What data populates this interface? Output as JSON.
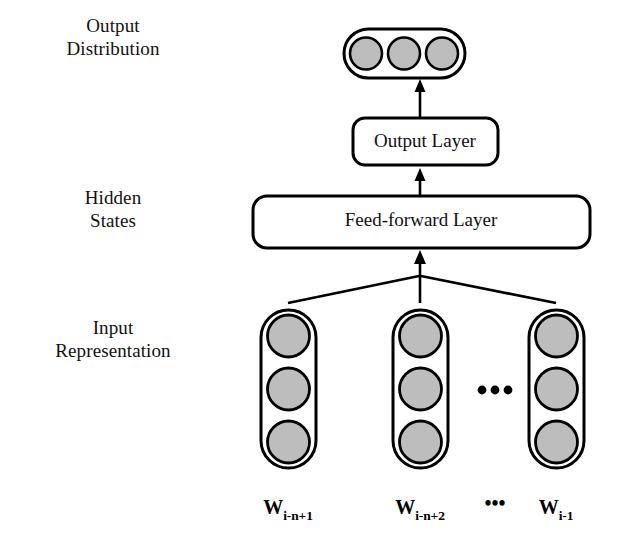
{
  "figure": {
    "type": "neural-network-architecture-diagram",
    "background_color": "#ffffff",
    "stroke_color": "#000000",
    "node_fill_color": "#bdbdbd"
  },
  "side_labels": [
    {
      "id": "output-distribution",
      "text": "Output\nDistribution"
    },
    {
      "id": "hidden-states",
      "text": "Hidden\nStates"
    },
    {
      "id": "input-representation",
      "text": "Input\nRepresentation"
    }
  ],
  "layers": {
    "output_distribution": {
      "label": "Output Distribution",
      "orientation": "horizontal",
      "unit_count": 3
    },
    "output_layer": {
      "label": "Output Layer"
    },
    "feed_forward_layer": {
      "label": "Feed-forward Layer"
    },
    "input_representation": {
      "label": "Input Representation",
      "orientation": "vertical",
      "column_count": 3,
      "units_per_column": 3
    }
  },
  "input_words": [
    {
      "base": "W",
      "subscript": "i-n+1"
    },
    {
      "base": "W",
      "subscript": "i-n+2"
    },
    {
      "base": "W",
      "subscript": "i-1"
    }
  ],
  "ellipsis": {
    "between_columns": "•••",
    "between_labels": "•••"
  },
  "connections": [
    {
      "from": "input_representation",
      "to": "feed_forward_layer",
      "style": "fan-in-arrow"
    },
    {
      "from": "feed_forward_layer",
      "to": "output_layer",
      "style": "arrow"
    },
    {
      "from": "output_layer",
      "to": "output_distribution",
      "style": "arrow"
    }
  ]
}
